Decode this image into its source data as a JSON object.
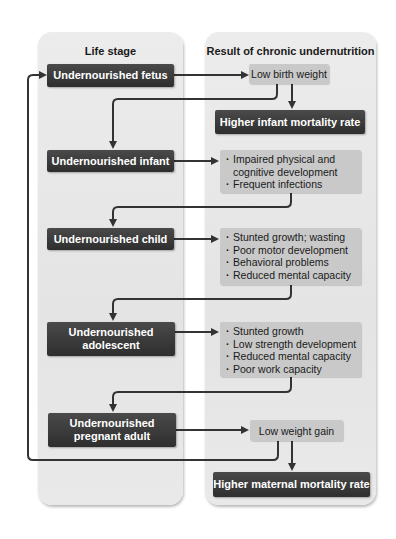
{
  "columns": {
    "left_title": "Life stage",
    "right_title": "Result of chronic undernutrition"
  },
  "life_stages": [
    {
      "label": "Undernourished fetus"
    },
    {
      "label": "Undernourished infant"
    },
    {
      "label": "Undernourished child"
    },
    {
      "label": "Undernourished adolescent"
    },
    {
      "label": "Undernourished pregnant adult"
    }
  ],
  "results": {
    "fetus": "Low birth weight",
    "fetus_outcome": "Higher infant mortality rate",
    "infant": [
      "Impaired physical and cognitive development",
      "Frequent infections"
    ],
    "child": [
      "Stunted growth; wasting",
      "Poor motor development",
      "Behavioral problems",
      "Reduced mental capacity"
    ],
    "adolescent": [
      "Stunted growth",
      "Low strength development",
      "Reduced mental capacity",
      "Poor work capacity"
    ],
    "pregnant_adult": "Low weight gain",
    "pregnant_adult_outcome": "Higher maternal mortality rate"
  },
  "colors": {
    "dark_box": "#333333",
    "light_box": "#c9c9c9",
    "panel": "#e8e8e8",
    "arrow": "#333333"
  }
}
